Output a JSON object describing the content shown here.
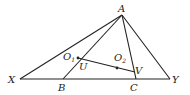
{
  "diagram": {
    "title": "",
    "points": {
      "A": {
        "label": "A",
        "x": 122,
        "y": 15
      },
      "X": {
        "label": "X",
        "x": 20,
        "y": 79
      },
      "Y": {
        "label": "Y",
        "x": 170,
        "y": 79
      },
      "B": {
        "label": "B",
        "x": 63,
        "y": 79
      },
      "C": {
        "label": "C",
        "x": 136,
        "y": 79
      },
      "U": {
        "label": "U",
        "x": 79,
        "y": 59
      },
      "V": {
        "label": "V",
        "x": 135,
        "y": 72
      },
      "O1": {
        "label": "O",
        "sub": "1",
        "x": 78,
        "y": 58
      },
      "O2": {
        "label": "O",
        "sub": "2",
        "x": 117,
        "y": 68
      }
    },
    "segments": [
      [
        "X",
        "Y"
      ],
      [
        "A",
        "X"
      ],
      [
        "A",
        "Y"
      ],
      [
        "A",
        "B"
      ],
      [
        "A",
        "C"
      ],
      [
        "O1",
        "V"
      ]
    ],
    "marked_points": [
      "O1",
      "O2"
    ],
    "line_color": "#222222"
  }
}
